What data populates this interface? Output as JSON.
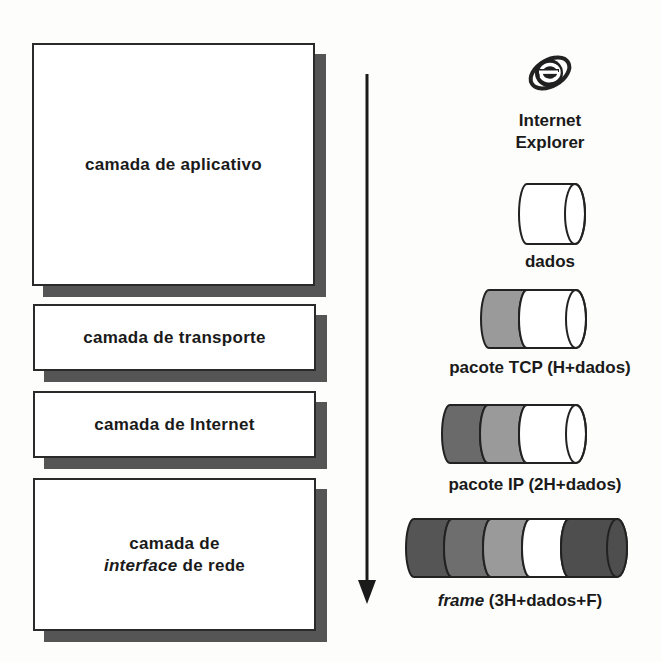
{
  "diagram": {
    "layers": [
      {
        "id": "aplicativo",
        "line1": "camada de aplicativo",
        "line2_italic": "",
        "line2_rest": ""
      },
      {
        "id": "transporte",
        "line1": "camada de transporte",
        "line2_italic": "",
        "line2_rest": ""
      },
      {
        "id": "internet",
        "line1": "camada de Internet",
        "line2_italic": "",
        "line2_rest": ""
      },
      {
        "id": "interface",
        "line1": "camada de",
        "line2_italic": "interface",
        "line2_rest": " de rede"
      }
    ],
    "flow_arrow": {
      "direction": "down"
    },
    "app_icon": {
      "icon": "internet-explorer-icon",
      "line1": "Internet",
      "line2": "Explorer"
    },
    "packets": [
      {
        "label_italic": "",
        "label": "dados",
        "segments": [
          "data"
        ]
      },
      {
        "label_italic": "",
        "label": "pacote TCP (H+dados)",
        "segments": [
          "H",
          "data"
        ]
      },
      {
        "label_italic": "",
        "label": "pacote IP (2H+dados)",
        "segments": [
          "H",
          "H",
          "data"
        ]
      },
      {
        "label_italic": "frame",
        "label": " (3H+dados+F)",
        "segments": [
          "H",
          "H",
          "H",
          "data",
          "F"
        ]
      }
    ],
    "colors": {
      "border": "#2a2a2a",
      "shadow": "#555555",
      "header_dark": "#5a5a5a",
      "header_mid": "#7d7d7d",
      "header_light": "#a0a0a0",
      "data": "#ffffff",
      "footer": "#4e4e4e"
    }
  }
}
